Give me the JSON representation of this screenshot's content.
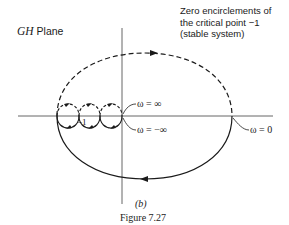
{
  "figure": {
    "plane_label_italic": "GH",
    "plane_label_rest": " Plane",
    "annotation": {
      "lines": [
        "Zero encirclements of",
        "the critical point −1",
        "(stable system)"
      ]
    },
    "labels": {
      "omega_infinity": "ω = ∞",
      "omega_neg_infinity": "ω = −∞",
      "omega_zero": "ω = 0",
      "critical_point": "−1"
    },
    "subfigure": "(b)",
    "caption": "Figure 7.27",
    "colors": {
      "ink": "#1a1a1a",
      "axis": "#555555",
      "background": "#ffffff"
    }
  }
}
